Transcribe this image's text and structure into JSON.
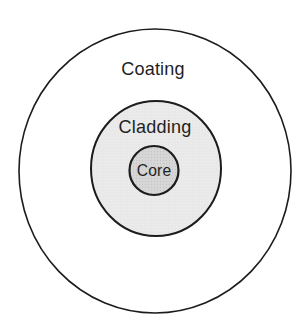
{
  "diagram": {
    "type": "concentric-circles",
    "labels": {
      "outer": "Coating",
      "middle": "Cladding",
      "inner": "Core"
    },
    "colors": {
      "background": "#ffffff",
      "outline": "#1c1c1c",
      "outer_fill": "#ffffff",
      "cladding_fill": "#ebebeb",
      "cladding_dot": "#dcdcdc",
      "core_fill": "#d7d7d7",
      "core_dot": "#c5c5c5",
      "text": "#1f1f1f"
    }
  }
}
